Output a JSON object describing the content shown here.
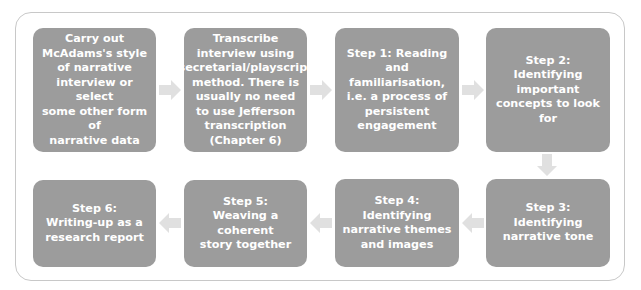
{
  "diagram": {
    "type": "flowchart",
    "colors": {
      "box_fill": "#9c9c9c",
      "box_text": "#ffffff",
      "arrow": "#e0e0e0",
      "frame_border": "#c8c8c8"
    },
    "steps": [
      {
        "id": "pre1",
        "label": "Carry out\nMcAdams's style\nof narrative\ninterview or select\nsome other form of\nnarrative data"
      },
      {
        "id": "pre2",
        "label": "Transcribe\ninterview using\nsecretarial/playscript\nmethod. There is\nusually no need\nto use Jefferson\ntranscription\n(Chapter 6)"
      },
      {
        "id": "step1",
        "label": "Step 1: Reading\nand familiarisation,\ni.e. a process of\npersistent\nengagement"
      },
      {
        "id": "step2",
        "label": "Step 2:\nIdentifying\nimportant\nconcepts to look\nfor"
      },
      {
        "id": "step3",
        "label": "Step 3:\nIdentifying\nnarrative tone"
      },
      {
        "id": "step4",
        "label": "Step 4:\nIdentifying\nnarrative themes\nand images"
      },
      {
        "id": "step5",
        "label": "Step 5:\nWeaving a coherent\nstory together"
      },
      {
        "id": "step6",
        "label": "Step 6:\nWriting-up as a\nresearch report"
      }
    ],
    "connections": [
      {
        "from": "pre1",
        "to": "pre2",
        "direction": "right"
      },
      {
        "from": "pre2",
        "to": "step1",
        "direction": "right"
      },
      {
        "from": "step1",
        "to": "step2",
        "direction": "right"
      },
      {
        "from": "step2",
        "to": "step3",
        "direction": "down"
      },
      {
        "from": "step3",
        "to": "step4",
        "direction": "left"
      },
      {
        "from": "step4",
        "to": "step5",
        "direction": "left"
      },
      {
        "from": "step5",
        "to": "step6",
        "direction": "left"
      }
    ]
  }
}
